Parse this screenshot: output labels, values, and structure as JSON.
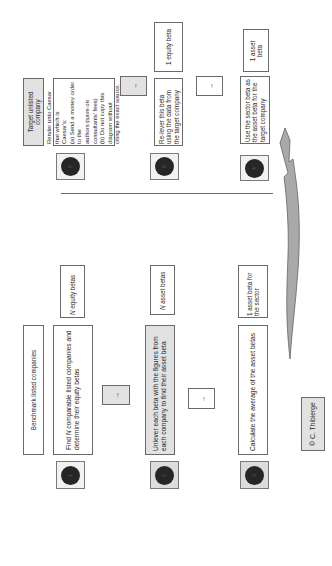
{
  "diagram": {
    "orientation": "rotated-90-ccw",
    "sections": {
      "target": {
        "header": "Target unlisted company",
        "steps": [
          {
            "number": "6",
            "text": "Render unto Caesar that which is Caesar's:\n(a) Send a money order to the authors (save on consultants' fees)\n(b) Do not copy this diagram without citing the exact source.",
            "lines": [
              "Render unto Caesar that which is",
              "Caesar's:",
              "(a) Send a money order to the",
              "authors (save on consultants' fees)",
              "(b) Do not copy this diagram without",
              "citing the exact source."
            ],
            "output": ""
          },
          {
            "number": "5",
            "text": "Re-lever this beta using the data from the target company",
            "output": "1 equity beta"
          },
          {
            "number": "4",
            "text": "Use the sector beta as the asset beta for the target company",
            "output": "1 asset beta"
          }
        ]
      },
      "benchmark": {
        "header": "Benchmark listed companies",
        "steps": [
          {
            "number": "1",
            "text_prefix": "Find ",
            "text_italic": "N",
            "text_suffix": " comparable listed companies and determine their equity betas",
            "output_italic": "N",
            "output_suffix": " equity betas"
          },
          {
            "number": "2",
            "text": "Unlever each beta with the figures from each company to find their asset beta",
            "output_italic": "N",
            "output_suffix": " asset betas"
          },
          {
            "number": "3",
            "text": "Calculate the average of the asset betas",
            "output": "1 asset beta for the sector"
          }
        ]
      }
    },
    "arrows": {
      "small_arrow_glyph": "→",
      "flow_arrow": "curved arrow from step 3 (sector beta) to step 4 (target company)"
    },
    "copyright": "© C. Thibierge"
  },
  "colors": {
    "border": "#6a6a6a",
    "gray_fill": "#e2e2e2",
    "circle_fill": "#262626",
    "arrow_fill": "#a9a9a9",
    "background": "#ffffff"
  }
}
